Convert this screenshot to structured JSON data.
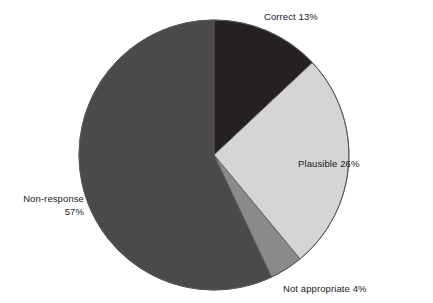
{
  "chart_data": {
    "type": "pie",
    "title": "",
    "subtitle": "",
    "xlabel": "",
    "ylabel": "",
    "grid": false,
    "legend_position": "none",
    "label_style": "outside-callout",
    "unit": "%",
    "start_angle_deg": 0,
    "direction": "clockwise",
    "categories": [
      "Correct",
      "Plausible",
      "Not appropriate",
      "Non-response"
    ],
    "values": [
      13,
      26,
      4,
      57
    ],
    "labels": [
      "Correct 13%",
      "Plausible 26%",
      "Not appropriate 4%",
      "Non-response 57%"
    ],
    "colors": [
      "#262020",
      "#d5d5d5",
      "#8a8a8a",
      "#4a4a4a"
    ],
    "slices": [
      {
        "name": "Correct",
        "value": 13,
        "label": "Correct 13%",
        "color": "#262020",
        "start_angle_deg": 0,
        "end_angle_deg": 46.8
      },
      {
        "name": "Plausible",
        "value": 26,
        "label": "Plausible 26%",
        "color": "#d5d5d5",
        "start_angle_deg": 46.8,
        "end_angle_deg": 140.4
      },
      {
        "name": "Not appropriate",
        "value": 4,
        "label": "Not appropriate 4%",
        "color": "#8a8a8a",
        "start_angle_deg": 140.4,
        "end_angle_deg": 154.8
      },
      {
        "name": "Non-response",
        "value": 57,
        "label": "Non-response 57%",
        "color": "#4a4a4a",
        "start_angle_deg": 154.8,
        "end_angle_deg": 360
      }
    ]
  },
  "figure": {
    "background_color": "#ffffff",
    "outline_color": "#585858",
    "center_x": 214,
    "center_y": 155,
    "radius": 135
  },
  "labels": {
    "correct": "Correct 13%",
    "plausible": "Plausible 26%",
    "not_appropriate": "Not appropriate 4%",
    "non_response_line1": "Non-response",
    "non_response_line2": "57%"
  }
}
